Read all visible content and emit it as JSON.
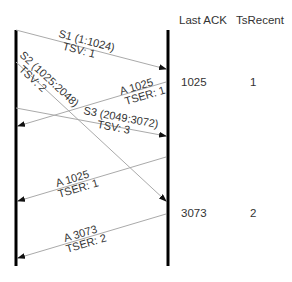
{
  "columns": {
    "last_ack": "Last ACK",
    "ts_recent": "TsRecent"
  },
  "state_rows": [
    {
      "last_ack": "1025",
      "ts_recent": "1"
    },
    {
      "last_ack": "3073",
      "ts_recent": "2"
    }
  ],
  "messages": [
    {
      "id": "S1",
      "direction": "left-to-right",
      "line1": "S1 (1:1024)",
      "line2": "TSV: 1"
    },
    {
      "id": "S2",
      "direction": "left-to-right",
      "line1": "S2 (1025:2048)",
      "line2": "TSV: 2"
    },
    {
      "id": "A1",
      "direction": "right-to-left",
      "line1": "A 1025",
      "line2": "TSER: 1"
    },
    {
      "id": "S3",
      "direction": "left-to-right",
      "line1": "S3 (2049:3072)",
      "line2": "TSV: 3"
    },
    {
      "id": "A2",
      "direction": "right-to-left",
      "line1": "A 1025",
      "line2": "TSER: 1"
    },
    {
      "id": "A3",
      "direction": "right-to-left",
      "line1": "A 3073",
      "line2": "TSER: 2"
    }
  ],
  "colors": {
    "lifeline": "#000000",
    "arrow": "#aaaaaa",
    "text": "#333333"
  }
}
